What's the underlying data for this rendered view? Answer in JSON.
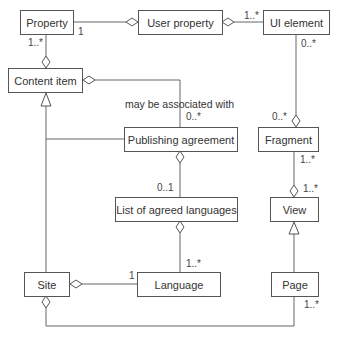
{
  "diagram": {
    "type": "UML class diagram",
    "classes": {
      "property": "Property",
      "user_property": "User property",
      "ui_element": "UI element",
      "content_item": "Content item",
      "publishing_agreement": "Publishing agreement",
      "fragment": "Fragment",
      "list_of_agreed_languages": "List of agreed languages",
      "view": "View",
      "site": "Site",
      "language": "Language",
      "page": "Page"
    },
    "association_note": "may be associated with",
    "multiplicities": {
      "property_to_user_property": "1",
      "property_to_content_item": "1..*",
      "user_property_to_ui_element": "1..*",
      "ui_element_to_fragment_top": "0..*",
      "ui_element_to_fragment_bottom": "0..*",
      "content_item_to_publishing_agreement": "0..*",
      "publishing_agreement_to_list": "0..1",
      "fragment_to_view_top": "1..*",
      "fragment_to_view_bottom": "1..*",
      "list_to_language": "1..*",
      "site_to_language": "1",
      "site_to_page": "1..*"
    },
    "relationships": [
      {
        "from": "Property",
        "to": "User property",
        "kind": "aggregation",
        "diamond_at": "User property"
      },
      {
        "from": "UI element",
        "to": "User property",
        "kind": "aggregation",
        "diamond_at": "User property"
      },
      {
        "from": "Property",
        "to": "Content item",
        "kind": "aggregation",
        "diamond_at": "Content item"
      },
      {
        "from": "Publishing agreement",
        "to": "Content item",
        "kind": "aggregation",
        "diamond_at": "Content item",
        "note": "may be associated with"
      },
      {
        "from": "UI element",
        "to": "Fragment",
        "kind": "aggregation",
        "diamond_at": "Fragment"
      },
      {
        "from": "Site",
        "to": "Content item",
        "kind": "generalization"
      },
      {
        "from": "Site",
        "to": "Publishing agreement",
        "kind": "association"
      },
      {
        "from": "List of agreed languages",
        "to": "Publishing agreement",
        "kind": "aggregation",
        "diamond_at": "Publishing agreement"
      },
      {
        "from": "Language",
        "to": "List of agreed languages",
        "kind": "aggregation",
        "diamond_at": "List of agreed languages"
      },
      {
        "from": "View",
        "to": "Fragment",
        "kind": "aggregation",
        "diamond_at": "View"
      },
      {
        "from": "Page",
        "to": "View",
        "kind": "generalization"
      },
      {
        "from": "Language",
        "to": "Site",
        "kind": "aggregation",
        "diamond_at": "Site"
      },
      {
        "from": "Page",
        "to": "Site",
        "kind": "aggregation",
        "diamond_at": "Site"
      }
    ],
    "colors": {
      "line": "#555555",
      "text": "#333333",
      "background": "#ffffff"
    }
  }
}
